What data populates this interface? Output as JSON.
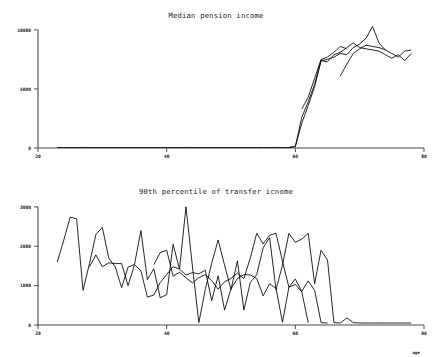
{
  "figure": {
    "background_color": "#ffffff",
    "line_color": "#000000",
    "axis_color": "#4a4a4a"
  },
  "chart_data": [
    {
      "type": "line",
      "title": "Median pension income",
      "xlabel": "",
      "ylabel": "",
      "xlim": [
        20,
        80
      ],
      "ylim": [
        0,
        10500
      ],
      "xticks": [
        20,
        40,
        60,
        80
      ],
      "xticklabels": [
        "20",
        "40",
        "60",
        "80"
      ],
      "yticks": [
        0,
        5000,
        10000
      ],
      "yticklabels": [
        "0",
        "5000",
        "10000"
      ],
      "grid": false,
      "legend": "none",
      "series": [
        {
          "name": "series-1",
          "x": [
            23,
            24,
            25,
            26,
            27,
            28,
            29,
            30,
            31,
            32,
            33,
            34,
            35,
            36,
            37,
            38,
            39,
            40,
            41,
            42,
            43,
            44,
            45,
            46,
            47,
            48,
            49,
            50,
            51,
            52,
            53,
            54,
            55,
            56,
            57,
            58,
            59,
            60,
            61,
            62,
            63,
            64,
            65,
            66,
            67,
            68,
            69,
            70,
            71,
            72,
            73,
            74,
            75,
            76,
            77,
            78
          ],
          "values": [
            40,
            40,
            40,
            40,
            40,
            40,
            40,
            40,
            40,
            40,
            40,
            40,
            40,
            40,
            40,
            40,
            40,
            40,
            40,
            40,
            40,
            40,
            40,
            40,
            40,
            40,
            40,
            40,
            40,
            40,
            40,
            40,
            40,
            40,
            40,
            40,
            40,
            120,
            2100,
            3600,
            5200,
            7400,
            7500,
            7700,
            8000,
            7900,
            8500,
            8800,
            9300,
            10300,
            8900,
            8300,
            8000,
            7700,
            8200,
            8300
          ]
        },
        {
          "name": "series-2",
          "x": [
            59,
            60,
            61,
            62,
            63,
            64,
            65,
            66,
            67,
            68,
            69,
            70,
            71,
            72,
            73,
            74,
            75,
            76,
            77,
            78
          ],
          "values": [
            40,
            130,
            2600,
            3900,
            5400,
            7400,
            7300,
            7900,
            8100,
            8500,
            8900,
            8500,
            8400,
            8300,
            8200,
            7900,
            7600,
            7900,
            7400,
            8000
          ]
        },
        {
          "name": "series-3",
          "x": [
            61,
            62,
            63,
            64,
            65,
            66,
            67,
            68
          ],
          "values": [
            3300,
            4300,
            5900,
            7500,
            7700,
            8100,
            8600,
            8400
          ]
        },
        {
          "name": "series-4",
          "x": [
            67,
            68,
            69,
            70,
            71,
            72,
            73,
            74
          ],
          "values": [
            6100,
            7100,
            8000,
            8400,
            8700,
            8600,
            8500,
            8300
          ]
        }
      ]
    },
    {
      "type": "line",
      "title": "90th percentile of transfer icnome",
      "xlabel": "age",
      "ylabel": "",
      "xlim": [
        20,
        80
      ],
      "ylim": [
        0,
        3150
      ],
      "xticks": [
        20,
        40,
        60,
        80
      ],
      "xticklabels": [
        "20",
        "40",
        "60",
        "80"
      ],
      "yticks": [
        0,
        1000,
        2000,
        3000
      ],
      "yticklabels": [
        "0",
        "1000",
        "2000",
        "3000"
      ],
      "grid": false,
      "legend": "none",
      "series": [
        {
          "name": "series-1",
          "x": [
            23,
            24,
            25,
            26,
            27,
            28,
            29,
            30,
            31,
            32,
            33,
            34,
            35,
            36,
            37,
            38,
            39,
            40,
            41,
            42,
            43,
            44,
            45,
            46,
            47,
            48,
            49,
            50,
            51,
            52,
            53,
            54,
            55,
            56,
            57,
            58,
            59,
            60,
            61,
            62,
            63,
            64,
            65,
            66,
            67,
            68,
            69,
            70,
            71,
            72,
            73,
            74,
            75,
            76,
            77,
            78
          ],
          "values": [
            1600,
            2150,
            2740,
            2700,
            880,
            1560,
            2300,
            2480,
            1700,
            1480,
            950,
            1470,
            1540,
            2400,
            1150,
            1430,
            690,
            770,
            2050,
            1420,
            3000,
            1500,
            60,
            900,
            1570,
            2160,
            1520,
            900,
            1630,
            380,
            1080,
            1280,
            1960,
            2220,
            900,
            1520,
            2330,
            2100,
            2180,
            2330,
            1050,
            1900,
            1650,
            60,
            50,
            180,
            60,
            50,
            50,
            50,
            50,
            50,
            50,
            50,
            50,
            50
          ]
        },
        {
          "name": "series-2",
          "x": [
            28,
            29,
            30,
            31,
            32,
            33,
            34,
            35,
            36,
            37,
            38,
            39,
            40,
            41,
            42,
            43,
            44,
            45,
            46,
            47,
            48,
            49,
            50,
            51,
            52,
            53,
            54,
            55,
            56,
            57,
            58,
            59,
            60,
            61,
            62,
            63,
            64,
            65
          ],
          "values": [
            1480,
            1780,
            1480,
            1580,
            1560,
            1560,
            1000,
            1530,
            1380,
            710,
            760,
            1080,
            1280,
            1480,
            1420,
            1270,
            1330,
            1300,
            1390,
            620,
            1250,
            380,
            920,
            1180,
            1280,
            1270,
            1180,
            740,
            1050,
            930,
            70,
            960,
            1170,
            850,
            1120,
            880,
            60,
            50
          ]
        },
        {
          "name": "series-3",
          "x": [
            38,
            39,
            40,
            41,
            42,
            43,
            44,
            45,
            46,
            47,
            48,
            49,
            50,
            51,
            52,
            53,
            54,
            55,
            56,
            57,
            58,
            59,
            60,
            61,
            62
          ],
          "values": [
            1530,
            1840,
            1900,
            1240,
            1340,
            1200,
            1070,
            1200,
            1280,
            1130,
            910,
            1100,
            1180,
            1320,
            1180,
            1700,
            2330,
            2060,
            2280,
            2330,
            1620,
            960,
            1030,
            840,
            60
          ]
        }
      ]
    }
  ]
}
